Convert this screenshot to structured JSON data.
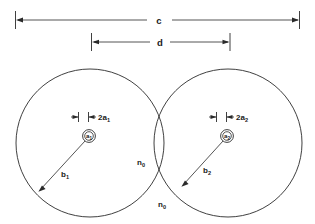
{
  "figure": {
    "background_color": "#ffffff",
    "line_color": "#2a2a2a"
  },
  "dimensions": {
    "overall": {
      "label": "c",
      "description": "overall outer span across both fiber claddings",
      "x_start": 15,
      "x_end": 300,
      "y": 20
    },
    "separation": {
      "label": "d",
      "description": "center-to-center separation of the two cores",
      "x_start": 91,
      "x_end": 230,
      "y": 42
    }
  },
  "circles": [
    {
      "name": "left-cladding",
      "cx": 90,
      "cy": 143,
      "r": 74,
      "core_label": "a",
      "core_subscript": "1",
      "core_diameter_label": "2a",
      "core_diameter_subscript": "1",
      "radius_label": "b",
      "radius_subscript": "1"
    },
    {
      "name": "right-cladding",
      "cx": 228,
      "cy": 143,
      "r": 74,
      "core_label": "a",
      "core_subscript": "2",
      "core_diameter_label": "2a",
      "core_diameter_subscript": "2",
      "radius_label": "b",
      "radius_subscript": "2"
    }
  ],
  "medium_labels": [
    {
      "name": "medium-index-upper",
      "label": "n",
      "subscript": "0",
      "x": 137,
      "y": 165
    },
    {
      "name": "medium-index-lower",
      "label": "n",
      "subscript": "0",
      "x": 158,
      "y": 207
    }
  ]
}
